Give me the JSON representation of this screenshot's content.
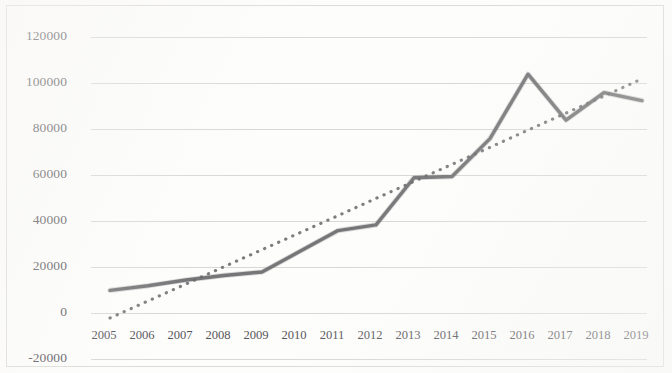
{
  "chart_data": {
    "type": "line",
    "title": "",
    "subtitle": "",
    "xlabel": "",
    "ylabel": "",
    "grid": true,
    "legend": "none",
    "x": [
      2005,
      2006,
      2007,
      2008,
      2009,
      2010,
      2011,
      2012,
      2013,
      2014,
      2015,
      2016,
      2017,
      2018,
      2019
    ],
    "categories": [
      "2005",
      "2006",
      "2007",
      "2008",
      "2009",
      "2010",
      "2011",
      "2012",
      "2013",
      "2014",
      "2015",
      "2016",
      "2017",
      "2018",
      "2019"
    ],
    "ylim": [
      -20000,
      120000
    ],
    "ytick_values": [
      120000,
      100000,
      80000,
      60000,
      40000,
      20000,
      0,
      -20000
    ],
    "ytick_labels": [
      "120000",
      "100000",
      "80000",
      "60000",
      "40000",
      "20000",
      "0",
      "-20000"
    ],
    "series": [
      {
        "name": "data",
        "style": "solid",
        "color": "#6e6e70",
        "values": [
          12000,
          14000,
          16500,
          18500,
          20000,
          29000,
          38000,
          40500,
          61000,
          61500,
          78000,
          106000,
          86000,
          98000,
          94500
        ]
      },
      {
        "name": "trendline",
        "style": "dotted",
        "color": "#6b6b6d",
        "values": [
          0,
          7400,
          14800,
          22300,
          29700,
          37100,
          44500,
          52000,
          59400,
          66800,
          74200,
          81700,
          89100,
          96500,
          104000
        ]
      }
    ]
  },
  "axes": {
    "y_axis_name": "value-axis",
    "x_axis_name": "year-axis"
  }
}
